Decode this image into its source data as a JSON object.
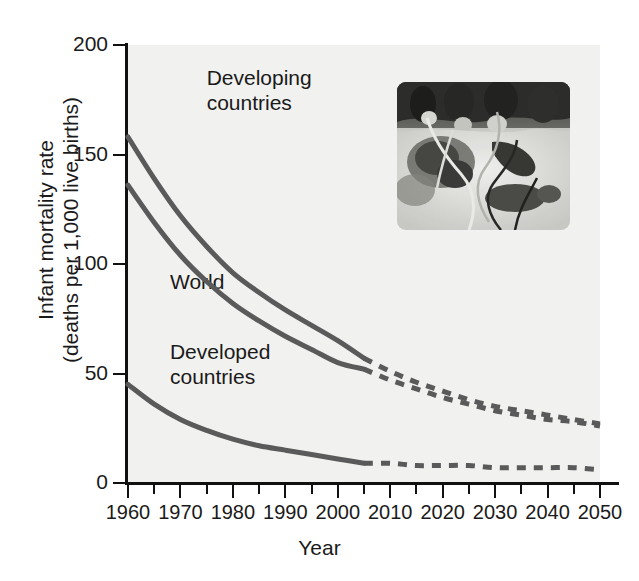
{
  "chart_data": {
    "type": "line",
    "title": "",
    "xlabel": "Year",
    "ylabel": "Infant mortality rate\n(deaths per 1,000 live births)",
    "ylabel_line1": "Infant mortality rate",
    "ylabel_line2": "(deaths per 1,000 live births)",
    "xlim": [
      1960,
      2050
    ],
    "ylim": [
      0,
      200
    ],
    "yticks": [
      0,
      50,
      100,
      150,
      200
    ],
    "ytick_labels": [
      "0",
      "50",
      "100",
      "150",
      "200"
    ],
    "xticks": [
      1960,
      1970,
      1980,
      1990,
      2000,
      2010,
      2020,
      2030,
      2040,
      2050
    ],
    "xtick_labels": [
      "1960",
      "1970",
      "1980",
      "1990",
      "2000",
      "2010",
      "2020",
      "2030",
      "2040",
      "2050"
    ],
    "xminor_step": 5,
    "grid": false,
    "legend_position": "inline-annotations",
    "projection_start_year": 2005,
    "series": [
      {
        "name": "Developing countries",
        "color": "#5a5a5a",
        "label_x": 1975,
        "label_y": 185,
        "x": [
          1960,
          1965,
          1970,
          1975,
          1980,
          1985,
          1990,
          1995,
          2000,
          2005,
          2010,
          2015,
          2020,
          2025,
          2030,
          2035,
          2040,
          2045,
          2050
        ],
        "y": [
          158,
          139,
          122,
          108,
          96,
          87,
          79,
          72,
          65,
          57,
          51,
          46,
          42,
          38,
          35,
          33,
          31,
          29,
          27
        ],
        "solid_until": 2005
      },
      {
        "name": "World",
        "color": "#5a5a5a",
        "label_x": 1968,
        "label_y": 92,
        "x": [
          1960,
          1965,
          1970,
          1975,
          1980,
          1985,
          1990,
          1995,
          2000,
          2005,
          2010,
          2015,
          2020,
          2025,
          2030,
          2035,
          2040,
          2045,
          2050
        ],
        "y": [
          136,
          119,
          104,
          92,
          82,
          74,
          67,
          61,
          55,
          52,
          47,
          43,
          39,
          36,
          33,
          31,
          29,
          28,
          26
        ],
        "solid_until": 2005
      },
      {
        "name": "Developed countries",
        "color": "#5a5a5a",
        "label_x": 1968,
        "label_y": 60,
        "x": [
          1960,
          1965,
          1970,
          1975,
          1980,
          1985,
          1990,
          1995,
          2000,
          2005,
          2010,
          2015,
          2020,
          2025,
          2030,
          2035,
          2040,
          2045,
          2050
        ],
        "y": [
          45,
          36,
          29,
          24,
          20,
          17,
          15,
          13,
          11,
          9,
          9,
          8,
          8,
          8,
          7,
          7,
          7,
          7,
          6
        ],
        "solid_until": 2005
      }
    ]
  },
  "axes": {
    "y_title_line1": "Infant mortality rate",
    "y_title_line2": "(deaths per 1,000 live births)",
    "x_title": "Year"
  },
  "annotations": {
    "developing": "Developing\ncountries",
    "world": "World",
    "developed": "Developed\ncountries"
  },
  "inset": {
    "name": "neonatal-infant-photo",
    "caption": ""
  },
  "colors": {
    "line": "#5a5a5a",
    "axis": "#111111",
    "plot_background": "#f1f1ef",
    "page_background": "#ffffff",
    "text": "#1a1a1a"
  }
}
